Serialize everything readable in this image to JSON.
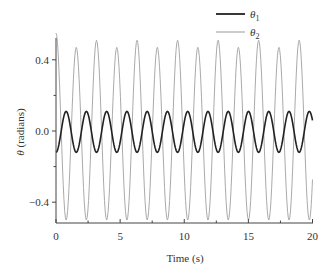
{
  "chart_data": {
    "type": "line",
    "title": "",
    "xlabel": "Time (s)",
    "ylabel": "θ (radians)",
    "xlim": [
      0,
      20
    ],
    "ylim": [
      -0.5,
      0.55
    ],
    "x_ticks": [
      0,
      5,
      10,
      15,
      20
    ],
    "x_tick_labels": [
      "0",
      "5",
      "10",
      "15",
      "20"
    ],
    "y_ticks": [
      0.4,
      0.0,
      -0.4
    ],
    "y_tick_labels": [
      "0.4",
      "0.0",
      "−0.4"
    ],
    "grid": false,
    "legend_position": "top-right",
    "period_s": 1.58,
    "series": [
      {
        "name": "θ1",
        "subscript": "1",
        "color": "#222222",
        "line_width": 1.6,
        "amplitude": 0.11,
        "phase": "antiphase to θ2",
        "start_value": -0.11,
        "peaks_t": [
          0.79,
          2.37,
          3.95,
          5.53,
          7.11,
          8.69,
          10.27,
          11.85,
          13.43,
          15.01,
          16.59,
          18.17,
          19.75
        ],
        "peak_value": 0.11,
        "troughs_t": [
          0,
          1.58,
          3.16,
          4.74,
          6.32,
          7.9,
          9.48,
          11.06,
          12.64,
          14.22,
          15.8,
          17.38,
          18.96
        ],
        "trough_value": -0.12,
        "end_value": 0.05
      },
      {
        "name": "θ2",
        "subscript": "2",
        "color": "#aaaaaa",
        "line_width": 1.0,
        "amplitude": 0.5,
        "start_value": 0.55,
        "peaks_t": [
          0,
          1.58,
          3.16,
          4.74,
          6.32,
          7.9,
          9.48,
          11.06,
          12.64,
          14.22,
          15.8,
          17.38,
          18.96
        ],
        "peak_values": [
          0.55,
          0.47,
          0.51,
          0.47,
          0.51,
          0.47,
          0.51,
          0.47,
          0.51,
          0.47,
          0.51,
          0.47,
          0.51
        ],
        "troughs_t": [
          0.79,
          2.37,
          3.95,
          5.53,
          7.11,
          8.69,
          10.27,
          11.85,
          13.43,
          15.01,
          16.59,
          18.17,
          19.75
        ],
        "trough_value": -0.5,
        "end_value": -0.23
      }
    ]
  },
  "legend": {
    "items": [
      {
        "symbol": "θ",
        "subscript": "1"
      },
      {
        "symbol": "θ",
        "subscript": "2"
      }
    ]
  },
  "axes": {
    "xlabel": "Time (s)",
    "ylabel_symbol": "θ",
    "ylabel_unit": " (radians)"
  }
}
